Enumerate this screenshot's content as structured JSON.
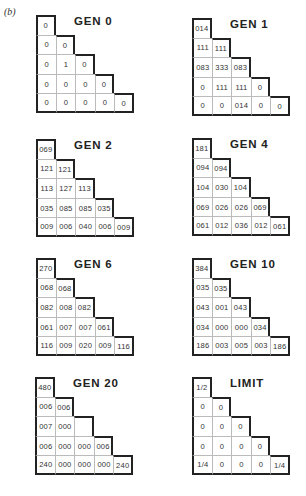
{
  "figure": {
    "panel_label": "(b)",
    "panels": [
      {
        "title": "GEN 0",
        "rows": [
          [
            "0"
          ],
          [
            "0",
            "0"
          ],
          [
            "0",
            "1",
            "0"
          ],
          [
            "0",
            "0",
            "0",
            "0"
          ],
          [
            "0",
            "0",
            "0",
            "0",
            "0"
          ]
        ]
      },
      {
        "title": "GEN 1",
        "rows": [
          [
            "014"
          ],
          [
            "111",
            "111"
          ],
          [
            "083",
            "333",
            "083"
          ],
          [
            "0",
            "111",
            "111",
            "0"
          ],
          [
            "0",
            "0",
            "014",
            "0",
            "0"
          ]
        ]
      },
      {
        "title": "GEN 2",
        "rows": [
          [
            "069"
          ],
          [
            "121",
            "121"
          ],
          [
            "113",
            "127",
            "113"
          ],
          [
            "035",
            "085",
            "085",
            "035"
          ],
          [
            "009",
            "006",
            "040",
            "006",
            "009"
          ]
        ]
      },
      {
        "title": "GEN 4",
        "rows": [
          [
            "181"
          ],
          [
            "094",
            "094"
          ],
          [
            "104",
            "030",
            "104"
          ],
          [
            "069",
            "026",
            "026",
            "069"
          ],
          [
            "061",
            "012",
            "036",
            "012",
            "061"
          ]
        ]
      },
      {
        "title": "GEN 6",
        "rows": [
          [
            "270"
          ],
          [
            "068",
            "068"
          ],
          [
            "082",
            "008",
            "082"
          ],
          [
            "061",
            "007",
            "007",
            "061"
          ],
          [
            "116",
            "009",
            "020",
            "009",
            "116"
          ]
        ]
      },
      {
        "title": "GEN 10",
        "rows": [
          [
            "384"
          ],
          [
            "035",
            "035"
          ],
          [
            "043",
            "001",
            "043"
          ],
          [
            "034",
            "000",
            "000",
            "034"
          ],
          [
            "186",
            "003",
            "005",
            "003",
            "186"
          ]
        ]
      },
      {
        "title": "GEN 20",
        "rows": [
          [
            "480"
          ],
          [
            "006",
            "006"
          ],
          [
            "007",
            "000",
            ""
          ],
          [
            "006",
            "000",
            "000",
            "006"
          ],
          [
            "240",
            "000",
            "000",
            "000",
            "240"
          ]
        ]
      },
      {
        "title": "LIMIT",
        "rows": [
          [
            "1/2"
          ],
          [
            "0",
            "0"
          ],
          [
            "0",
            "0",
            "0"
          ],
          [
            "0",
            "0",
            "0",
            "0"
          ],
          [
            "1/4",
            "0",
            "0",
            "0",
            "1/4"
          ]
        ]
      }
    ]
  },
  "colors": {
    "border": "#222222",
    "gridline": "#bbbbbb",
    "text": "#333333",
    "background": "#ffffff"
  }
}
